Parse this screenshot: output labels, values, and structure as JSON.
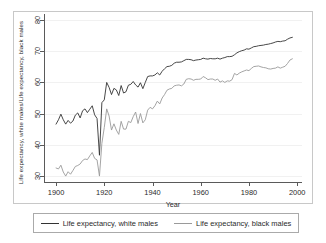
{
  "chart_data": {
    "type": "line",
    "title": "",
    "xlabel": "Year",
    "ylabel": "Life expectancy, white males/Life expectancy, black males",
    "xlim": [
      1895,
      2002
    ],
    "ylim": [
      28,
      82
    ],
    "xticks": [
      1900,
      1920,
      1940,
      1960,
      1980,
      2000
    ],
    "yticks": [
      30,
      40,
      50,
      60,
      70,
      80
    ],
    "grid": true,
    "legend_position": "bottom",
    "series": [
      {
        "name": "Life expectancy, white males",
        "color": "#333333",
        "x": [
          1900,
          1901,
          1902,
          1903,
          1904,
          1905,
          1906,
          1907,
          1908,
          1909,
          1910,
          1911,
          1912,
          1913,
          1914,
          1915,
          1916,
          1917,
          1918,
          1919,
          1920,
          1921,
          1922,
          1923,
          1924,
          1925,
          1926,
          1927,
          1928,
          1929,
          1930,
          1931,
          1932,
          1933,
          1934,
          1935,
          1936,
          1937,
          1938,
          1939,
          1940,
          1941,
          1942,
          1943,
          1944,
          1945,
          1946,
          1947,
          1948,
          1949,
          1950,
          1951,
          1952,
          1953,
          1954,
          1955,
          1956,
          1957,
          1958,
          1959,
          1960,
          1961,
          1962,
          1963,
          1964,
          1965,
          1966,
          1967,
          1968,
          1969,
          1970,
          1971,
          1972,
          1973,
          1974,
          1975,
          1976,
          1977,
          1978,
          1979,
          1980,
          1981,
          1982,
          1983,
          1984,
          1985,
          1986,
          1987,
          1988,
          1989,
          1990,
          1991,
          1992,
          1993,
          1994,
          1995,
          1996,
          1997,
          1998
        ],
        "values": [
          46.6,
          48.0,
          49.8,
          48.0,
          46.6,
          47.8,
          46.9,
          47.6,
          49.5,
          50.2,
          48.6,
          50.9,
          51.5,
          50.3,
          51.4,
          52.5,
          49.6,
          48.4,
          36.6,
          53.5,
          54.4,
          60.0,
          58.4,
          56.1,
          58.1,
          57.6,
          55.8,
          59.0,
          56.6,
          57.0,
          59.1,
          59.4,
          60.3,
          59.2,
          58.5,
          59.9,
          58.0,
          60.0,
          61.9,
          62.1,
          62.1,
          62.4,
          63.1,
          62.4,
          63.6,
          64.4,
          65.1,
          65.2,
          65.5,
          66.2,
          66.5,
          66.5,
          66.6,
          67.0,
          67.4,
          67.4,
          67.3,
          67.0,
          67.2,
          67.3,
          67.4,
          67.8,
          67.6,
          67.5,
          67.7,
          67.6,
          67.6,
          67.8,
          67.5,
          67.8,
          68.0,
          68.3,
          68.3,
          68.4,
          68.9,
          69.5,
          69.9,
          70.2,
          70.4,
          70.8,
          70.7,
          71.1,
          71.5,
          71.6,
          71.8,
          71.9,
          72.0,
          72.2,
          72.3,
          72.5,
          72.7,
          73.0,
          73.2,
          73.1,
          73.3,
          73.4,
          73.9,
          74.3,
          74.5
        ]
      },
      {
        "name": "Life expectancy, black males",
        "color": "#9a9a9a",
        "x": [
          1900,
          1901,
          1902,
          1903,
          1904,
          1905,
          1906,
          1907,
          1908,
          1909,
          1910,
          1911,
          1912,
          1913,
          1914,
          1915,
          1916,
          1917,
          1918,
          1919,
          1920,
          1921,
          1922,
          1923,
          1924,
          1925,
          1926,
          1927,
          1928,
          1929,
          1930,
          1931,
          1932,
          1933,
          1934,
          1935,
          1936,
          1937,
          1938,
          1939,
          1940,
          1941,
          1942,
          1943,
          1944,
          1945,
          1946,
          1947,
          1948,
          1949,
          1950,
          1951,
          1952,
          1953,
          1954,
          1955,
          1956,
          1957,
          1958,
          1959,
          1960,
          1961,
          1962,
          1963,
          1964,
          1965,
          1966,
          1967,
          1968,
          1969,
          1970,
          1971,
          1972,
          1973,
          1974,
          1975,
          1976,
          1977,
          1978,
          1979,
          1980,
          1981,
          1982,
          1983,
          1984,
          1985,
          1986,
          1987,
          1988,
          1989,
          1990,
          1991,
          1992,
          1993,
          1994,
          1995,
          1996,
          1997,
          1998
        ],
        "values": [
          32.5,
          32.2,
          33.4,
          31.2,
          29.9,
          31.3,
          30.5,
          31.7,
          33.0,
          33.3,
          33.8,
          34.9,
          35.4,
          35.2,
          36.4,
          37.5,
          35.6,
          35.1,
          29.9,
          40.4,
          45.5,
          51.5,
          49.2,
          44.7,
          46.7,
          44.7,
          43.3,
          47.5,
          45.0,
          45.0,
          47.5,
          47.1,
          49.0,
          50.5,
          46.8,
          50.0,
          47.0,
          48.0,
          51.1,
          52.0,
          51.5,
          52.5,
          54.0,
          53.1,
          55.0,
          56.1,
          57.5,
          57.9,
          58.1,
          58.9,
          59.1,
          59.2,
          58.9,
          59.5,
          61.0,
          61.2,
          61.1,
          60.7,
          61.0,
          61.0,
          61.1,
          61.9,
          61.5,
          60.9,
          61.1,
          61.1,
          60.7,
          61.1,
          60.1,
          60.5,
          60.0,
          60.5,
          60.4,
          60.9,
          62.9,
          62.4,
          63.0,
          63.4,
          63.7,
          64.0,
          63.8,
          64.5,
          65.1,
          65.2,
          65.3,
          65.0,
          64.8,
          64.7,
          64.4,
          64.3,
          64.5,
          64.6,
          65.0,
          64.6,
          64.9,
          65.2,
          66.1,
          67.2,
          67.6
        ]
      }
    ]
  },
  "legend": {
    "items": [
      {
        "label": "Life expectancy, white males",
        "color": "#333333"
      },
      {
        "label": "Life expectancy, black males",
        "color": "#9a9a9a"
      }
    ]
  }
}
